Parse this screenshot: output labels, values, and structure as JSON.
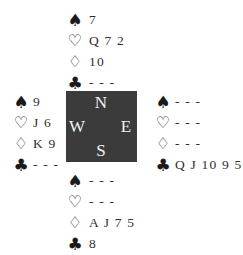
{
  "diagram": {
    "type": "bridge-deal",
    "compass": {
      "north": "N",
      "south": "S",
      "east": "E",
      "west": "W",
      "background": "#3b3b3b"
    },
    "suit_icons": {
      "spades": "♠",
      "hearts": "♡",
      "diamonds": "♢",
      "clubs": "♣"
    },
    "hands": {
      "north": {
        "spades": "7",
        "hearts": "Q 7 2",
        "diamonds": "10",
        "clubs": "- - -"
      },
      "west": {
        "spades": "9",
        "hearts": "J 6",
        "diamonds": "K 9",
        "clubs": "- - -"
      },
      "east": {
        "spades": "- - -",
        "hearts": "- - -",
        "diamonds": "- - -",
        "clubs": "Q J 10 9 5"
      },
      "south": {
        "spades": "- - -",
        "hearts": "- - -",
        "diamonds": "A J 7 5",
        "clubs": "8"
      }
    }
  }
}
